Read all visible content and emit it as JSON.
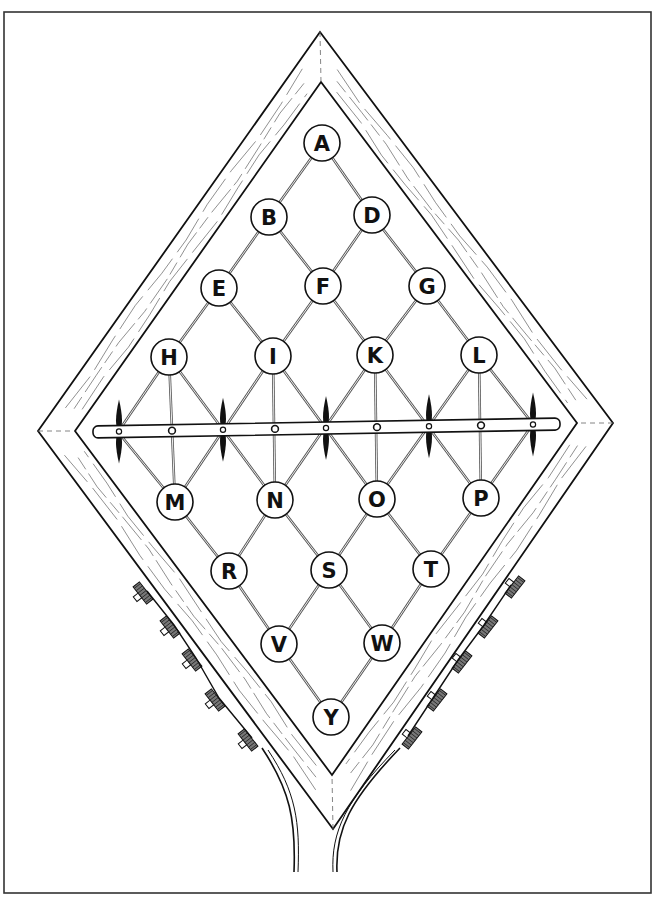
{
  "figure": {
    "border": {
      "x": 4,
      "y": 12,
      "width": 647,
      "height": 881,
      "color": "#333333"
    },
    "frame": {
      "outer": {
        "top": [
          320,
          32
        ],
        "right": [
          613,
          423
        ],
        "bottom": [
          333,
          829
        ],
        "left": [
          38,
          431
        ]
      },
      "inner": {
        "top": [
          321,
          82
        ],
        "right": [
          577,
          423
        ],
        "bottom": [
          332,
          775
        ],
        "left": [
          75,
          431
        ]
      },
      "stroke_color": "#111111"
    },
    "nodes": [
      {
        "label": "A",
        "x": 322,
        "y": 143
      },
      {
        "label": "B",
        "x": 269,
        "y": 217
      },
      {
        "label": "D",
        "x": 372,
        "y": 215
      },
      {
        "label": "E",
        "x": 219,
        "y": 288
      },
      {
        "label": "F",
        "x": 323,
        "y": 286
      },
      {
        "label": "G",
        "x": 427,
        "y": 286
      },
      {
        "label": "H",
        "x": 169,
        "y": 357
      },
      {
        "label": "I",
        "x": 273,
        "y": 356
      },
      {
        "label": "K",
        "x": 375,
        "y": 355
      },
      {
        "label": "L",
        "x": 479,
        "y": 355
      },
      {
        "label": "M",
        "x": 175,
        "y": 502
      },
      {
        "label": "N",
        "x": 275,
        "y": 500
      },
      {
        "label": "O",
        "x": 377,
        "y": 499
      },
      {
        "label": "P",
        "x": 481,
        "y": 498
      },
      {
        "label": "R",
        "x": 229,
        "y": 571
      },
      {
        "label": "S",
        "x": 329,
        "y": 570
      },
      {
        "label": "T",
        "x": 431,
        "y": 569
      },
      {
        "label": "V",
        "x": 279,
        "y": 644
      },
      {
        "label": "W",
        "x": 382,
        "y": 643
      },
      {
        "label": "Y",
        "x": 331,
        "y": 717
      }
    ],
    "node_radius": 18,
    "crossbar": {
      "start": [
        93,
        432
      ],
      "end": [
        560,
        424
      ],
      "thickness": 12,
      "spindles_x": [
        119,
        223,
        326,
        429,
        533
      ],
      "dots_x": [
        172,
        275,
        377,
        481
      ]
    },
    "pegs": {
      "left": [
        [
          143,
          593
        ],
        [
          170,
          627
        ],
        [
          192,
          660
        ],
        [
          215,
          700
        ],
        [
          248,
          740
        ]
      ],
      "right": [
        [
          515,
          587
        ],
        [
          488,
          627
        ],
        [
          462,
          662
        ],
        [
          437,
          700
        ],
        [
          412,
          738
        ]
      ]
    },
    "trunk": {
      "left_path": "M 262 748 C 290 790, 296 820, 294 872",
      "left_path_2": "M 268 750 C 296 792, 300 822, 298 872",
      "right_path": "M 400 748 C 350 800, 335 830, 337 872",
      "right_path_2": "M 395 750 C 346 800, 331 832, 333 872"
    }
  }
}
